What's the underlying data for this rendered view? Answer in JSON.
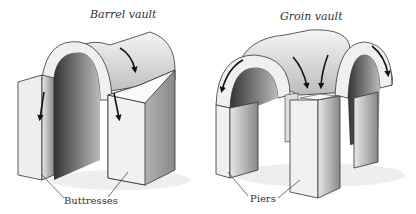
{
  "diagrams": [
    {
      "title": "Barrel vault",
      "callout": "Buttresses"
    },
    {
      "title": "Groin vault",
      "callout": "Piers"
    }
  ],
  "colors": {
    "stone_light": "#f2f2f2",
    "stone_mid": "#d6d6d6",
    "stone_dark": "#555555",
    "outline": "#222222",
    "arrow": "#111111"
  }
}
